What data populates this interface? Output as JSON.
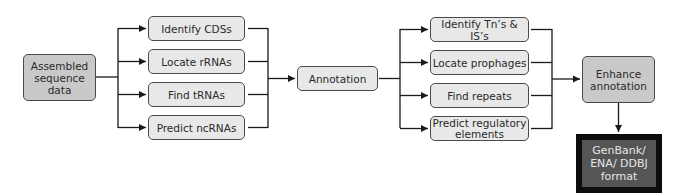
{
  "diagram": {
    "input": {
      "label": "Assembled sequence data"
    },
    "stage1_steps": [
      {
        "label": "Identify CDSs"
      },
      {
        "label": "Locate rRNAs"
      },
      {
        "label": "Find tRNAs"
      },
      {
        "label": "Predict ncRNAs"
      }
    ],
    "annotation": {
      "label": "Annotation"
    },
    "stage2_steps": [
      {
        "label": "Identify Tn’s & IS’s"
      },
      {
        "label": "Locate prophages"
      },
      {
        "label": "Find repeats"
      },
      {
        "label": "Predict regulatory elements"
      }
    ],
    "enhance": {
      "label": "Enhance annotation"
    },
    "output": {
      "label": "GenBank/ ENA/ DDBJ format"
    }
  },
  "colors": {
    "box_fill": "#e8e8e8",
    "box_fill_dark": "#c9c9c9",
    "output_fill": "#555555",
    "output_border": "#0d0d0d",
    "line": "#1a1a1a"
  }
}
